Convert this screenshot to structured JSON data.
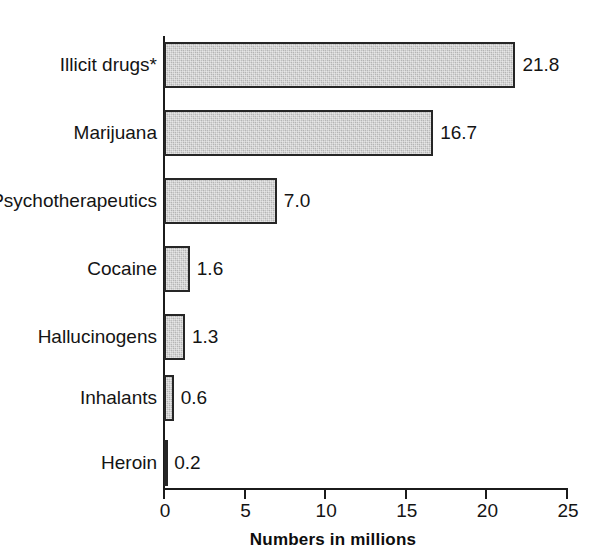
{
  "chart_data": {
    "type": "bar",
    "orientation": "horizontal",
    "title": "",
    "xlabel": "Numbers in millions",
    "ylabel": "",
    "xlim": [
      0,
      25
    ],
    "xticks": [
      0,
      5,
      10,
      15,
      20,
      25
    ],
    "xtick_labels": [
      "0",
      "5",
      "10",
      "15",
      "20",
      "25"
    ],
    "grid": false,
    "legend": null,
    "categories": [
      "Illicit drugs*",
      "Marijuana",
      "Psychotherapeutics",
      "Cocaine",
      "Hallucinogens",
      "Inhalants",
      "Heroin"
    ],
    "values": [
      21.8,
      16.7,
      7.0,
      1.6,
      1.3,
      0.6,
      0.2
    ],
    "value_labels": [
      "21.8",
      "16.7",
      "7.0",
      "1.6",
      "1.3",
      "0.6",
      "0.2"
    ],
    "bar_fill_color": "#bdbdbd",
    "bar_border_color": "#262626",
    "axis_color": "#1b1b1b",
    "text_color": "#141414"
  }
}
